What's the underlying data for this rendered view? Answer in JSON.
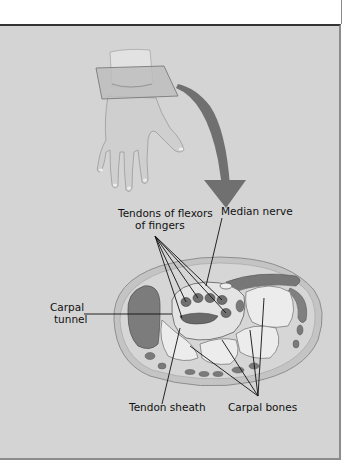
{
  "figure": {
    "labels": {
      "tendons_line1": "Tendons of flexors",
      "tendons_line2": "of fingers",
      "median_nerve": "Median nerve",
      "carpal_tunnel_line1": "Carpal",
      "carpal_tunnel_line2": "tunnel",
      "tendon_sheath": "Tendon sheath",
      "carpal_bones": "Carpal bones"
    },
    "colors": {
      "panel_background": "#d4d4d4",
      "arrow": "#6e6e6e",
      "skin": "#c9c9c9",
      "bone": "#ececec",
      "tendon": "#7a7a7a",
      "muscle": "#8a8a8a"
    }
  }
}
